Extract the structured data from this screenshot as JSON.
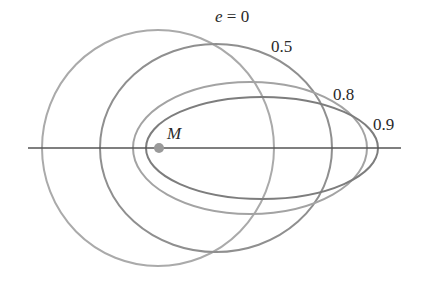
{
  "diagram": {
    "focus": {
      "label": "M",
      "x": 159,
      "y": 148,
      "color": "#9a9a9a"
    },
    "axis": {
      "x1": 28,
      "x2": 401,
      "y": 148,
      "color": "#555555"
    },
    "orbits": [
      {
        "eccentricity": "0",
        "label": "e = 0",
        "cx": 158,
        "cy": 148,
        "rx": 116,
        "ry": 118,
        "color": "#aaaaaa",
        "label_x": 215,
        "label_y": 22
      },
      {
        "eccentricity": "0.5",
        "label": "0.5",
        "cx": 216,
        "cy": 148,
        "rx": 116,
        "ry": 104,
        "color": "#8f8f8f",
        "label_x": 271,
        "label_y": 52
      },
      {
        "eccentricity": "0.8",
        "label": "0.8",
        "cx": 250,
        "cy": 148,
        "rx": 117,
        "ry": 66,
        "color": "#a3a3a3",
        "label_x": 333,
        "label_y": 100
      },
      {
        "eccentricity": "0.9",
        "label": "0.9",
        "cx": 262,
        "cy": 148,
        "rx": 116,
        "ry": 51,
        "color": "#7d7d7d",
        "label_x": 373,
        "label_y": 130
      }
    ]
  }
}
